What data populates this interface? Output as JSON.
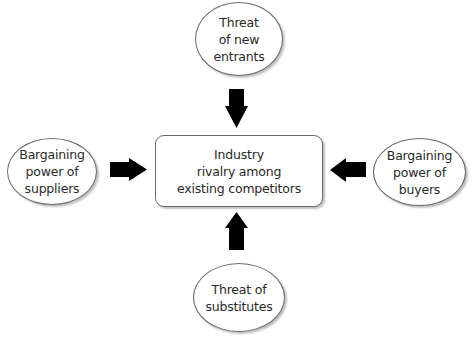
{
  "diagram": {
    "center": {
      "label": "Industry\nrivalry among\nexisting competitors"
    },
    "forces": {
      "top": {
        "label": "Threat\nof new\nentrants",
        "arrow_direction": "down"
      },
      "left": {
        "label": "Bargaining\npower of\nsuppliers",
        "arrow_direction": "right"
      },
      "right": {
        "label": "Bargaining\npower of\nbuyers",
        "arrow_direction": "left"
      },
      "bottom": {
        "label": "Threat of\nsubstitutes",
        "arrow_direction": "up"
      }
    },
    "colors": {
      "arrow": "#000000",
      "border": "#6a6a6a",
      "text": "#2a2a2a",
      "background": "#ffffff"
    }
  }
}
